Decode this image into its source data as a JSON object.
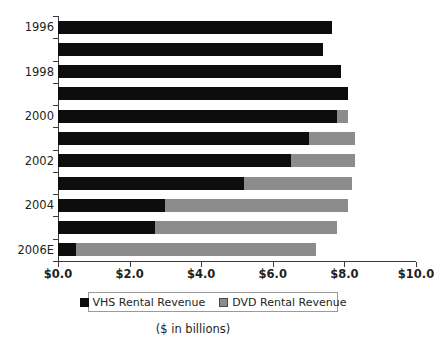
{
  "chart_data": {
    "type": "bar",
    "orientation": "horizontal",
    "stacked": true,
    "title": "",
    "subtitle": "",
    "xlabel": "($ in billions)",
    "ylabel": "",
    "xlim": [
      0.0,
      10.0
    ],
    "xticks": [
      0.0,
      2.0,
      4.0,
      6.0,
      8.0,
      10.0
    ],
    "xticklabels": [
      "$0.0",
      "$2.0",
      "$4.0",
      "$6.0",
      "$8.0",
      "$10.0"
    ],
    "grid": false,
    "legend_position": "bottom",
    "categories": [
      "1996",
      "1997",
      "1998",
      "1999",
      "2000",
      "2001",
      "2002",
      "2003",
      "2004",
      "2005",
      "2006E"
    ],
    "category_labels_shown": [
      "1996",
      "",
      "1998",
      "",
      "2000",
      "",
      "2002",
      "",
      "2004",
      "",
      "2006E"
    ],
    "series": [
      {
        "name": "VHS Rental Revenue",
        "color": "#0d0d0d",
        "values": [
          7.65,
          7.4,
          7.9,
          8.1,
          7.8,
          7.0,
          6.5,
          5.2,
          3.0,
          2.7,
          0.5
        ]
      },
      {
        "name": "DVD Rental Revenue",
        "color": "#8c8c8c",
        "values": [
          0.0,
          0.0,
          0.0,
          0.0,
          0.3,
          1.3,
          1.8,
          3.0,
          5.1,
          5.1,
          6.7
        ]
      }
    ],
    "totals": [
      7.65,
      7.4,
      7.9,
      8.1,
      8.1,
      8.3,
      8.3,
      8.2,
      8.1,
      7.8,
      7.2
    ]
  },
  "legend": {
    "items": [
      {
        "label": "VHS Rental Revenue",
        "swatch": "vhs-swatch-icon"
      },
      {
        "label": "DVD Rental Revenue",
        "swatch": "dvd-swatch-icon"
      }
    ]
  },
  "footnote": {
    "text": "($ in billions)"
  },
  "colors": {
    "vhs": "#0d0d0d",
    "dvd": "#8c8c8c",
    "axis": "#3a3a3a",
    "text": "#231f20",
    "background": "#ffffff"
  }
}
